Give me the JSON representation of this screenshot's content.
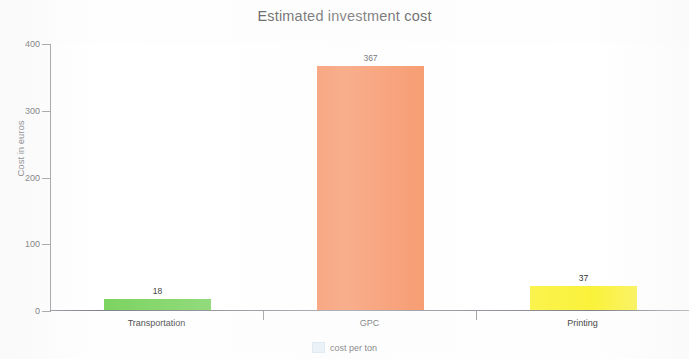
{
  "chart_data": {
    "type": "bar",
    "title": "Estimated investment cost",
    "xlabel": "",
    "ylabel": "Cost in euros",
    "categories": [
      "Transportation",
      "GPC",
      "Printing"
    ],
    "values": [
      18,
      367,
      37
    ],
    "value_labels": [
      "18",
      "367",
      "37"
    ],
    "series": [
      {
        "name": "cost per ton",
        "values": [
          18,
          367,
          37
        ]
      }
    ],
    "bar_colors": [
      "#7ad35f",
      "#f57a41",
      "#faf23a"
    ],
    "ylim": [
      0,
      400
    ],
    "y_ticks": [
      0,
      100,
      200,
      300,
      400
    ],
    "y_tick_labels": [
      "0",
      "100",
      "200",
      "300",
      "400"
    ],
    "grid": false,
    "legend": {
      "position": "bottom",
      "entries": [
        {
          "label": "cost per ton",
          "swatch_color": "#d8e6f2"
        }
      ]
    },
    "axis_color": "#8e8e94",
    "plot_background": "#ffffff"
  }
}
